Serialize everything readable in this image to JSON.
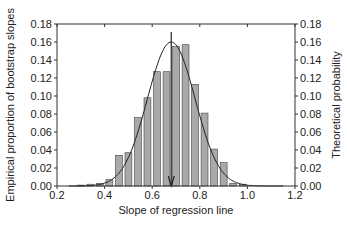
{
  "chart_data": {
    "type": "bar",
    "title": "",
    "xlabel": "Slope of regression line",
    "ylabel": "Empirical proportion of bootstrap slopes",
    "ylabel_right": "Theoretical probability",
    "xlim": [
      0.2,
      1.2
    ],
    "ylim": [
      0,
      0.18
    ],
    "xticks": [
      "0.2",
      "0.4",
      "0.6",
      "0.8",
      "1.0",
      "1.2"
    ],
    "yticks": [
      "0.00",
      "0.02",
      "0.04",
      "0.06",
      "0.08",
      "0.10",
      "0.12",
      "0.14",
      "0.16",
      "0.18"
    ],
    "bin_width": 0.04,
    "categories": [
      0.3,
      0.34,
      0.38,
      0.42,
      0.46,
      0.5,
      0.54,
      0.58,
      0.62,
      0.66,
      0.7,
      0.74,
      0.78,
      0.82,
      0.86,
      0.9,
      0.94,
      0.98
    ],
    "values": [
      0.001,
      0.002,
      0.003,
      0.007,
      0.034,
      0.037,
      0.076,
      0.098,
      0.127,
      0.127,
      0.155,
      0.157,
      0.113,
      0.081,
      0.041,
      0.026,
      0.003,
      0.002
    ],
    "series": [
      {
        "name": "Empirical proportion of bootstrap slopes",
        "type": "bar"
      },
      {
        "name": "Theoretical probability (normal curve)",
        "type": "line",
        "mean": 0.68,
        "sd": 0.1,
        "peak": 0.16
      }
    ],
    "annotations": [
      {
        "type": "arrow",
        "x": 0.68,
        "label": "observed slope"
      }
    ],
    "grid": false,
    "legend": "none",
    "bar_color": "#a9a9a9"
  }
}
